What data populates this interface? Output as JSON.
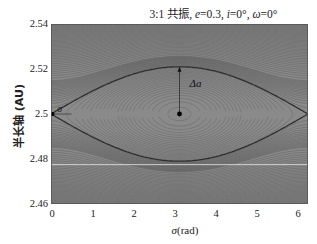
{
  "chart_data": {
    "type": "contour",
    "title": "3:1 共振, e=0.3, i=0°, ω=0°",
    "xlabel": "σ (rad)",
    "ylabel": "半长轴 (AU)",
    "xlim": [
      0,
      6.2832
    ],
    "ylim": [
      2.46,
      2.54
    ],
    "x_ticks": [
      "0",
      "1",
      "2",
      "3",
      "4",
      "5",
      "6"
    ],
    "y_ticks": [
      "2.54",
      "2.52",
      "2.5",
      "2.48",
      "2.46"
    ],
    "separatrix": {
      "center_sigma": 3.1416,
      "center_a": 2.5,
      "a_max": 2.521,
      "a_min": 2.479,
      "saddle_sigma": [
        0,
        6.2832
      ]
    },
    "stable_point": {
      "sigma": 3.1416,
      "a": 2.5
    },
    "unstable_point": {
      "sigma": 0,
      "a": 2.5
    },
    "annotations": [
      {
        "text": "Δa",
        "sigma": 3.6,
        "a": 2.513
      },
      {
        "text": "σ",
        "sigma": 0.35,
        "a": 2.5
      }
    ],
    "grid": false,
    "legend": null
  },
  "title": {
    "main": "3:1 共振, ",
    "e": "e",
    "e_val": "=0.3, ",
    "i": "i",
    "i_val": "=0°, ",
    "w": "ω",
    "w_val": "=0°"
  },
  "axes": {
    "xlabel_sym": "σ",
    "xlabel_unit": "(rad)",
    "ylabel": "半长轴 (AU)",
    "yticks": [
      "2.54",
      "2.52",
      "2.5",
      "2.48",
      "2.46"
    ],
    "xticks": [
      "0",
      "1",
      "2",
      "3",
      "4",
      "5",
      "6"
    ]
  },
  "annotations": {
    "delta_a": "Δa",
    "sigma": "σ"
  }
}
